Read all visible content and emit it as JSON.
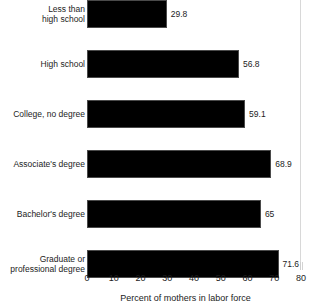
{
  "chart_data": {
    "type": "bar",
    "orientation": "horizontal",
    "title": "",
    "xlabel": "Percent of mothers in labor force",
    "ylabel": "",
    "xlim": [
      0,
      80
    ],
    "xticks": [
      0,
      10,
      20,
      30,
      40,
      50,
      60,
      70,
      80
    ],
    "grid": false,
    "legend": null,
    "categories": [
      "Less than\nhigh school",
      "High school",
      "College, no degree",
      "Associate's degree",
      "Bachelor's degree",
      "Graduate or\nprofessional degree"
    ],
    "values": [
      29.8,
      56.8,
      59.1,
      68.9,
      65,
      71.6
    ],
    "value_labels": [
      "29.8",
      "56.8",
      "59.1",
      "68.9",
      "65",
      "71.6"
    ],
    "bar_color": "#000000",
    "bar_edge_color": "#4a4a4a",
    "background_color": "#ffffff"
  },
  "axis": {
    "tick_labels": [
      "0",
      "10",
      "20",
      "30",
      "40",
      "50",
      "60",
      "70",
      "80"
    ],
    "title": "Percent of mothers in labor force"
  }
}
